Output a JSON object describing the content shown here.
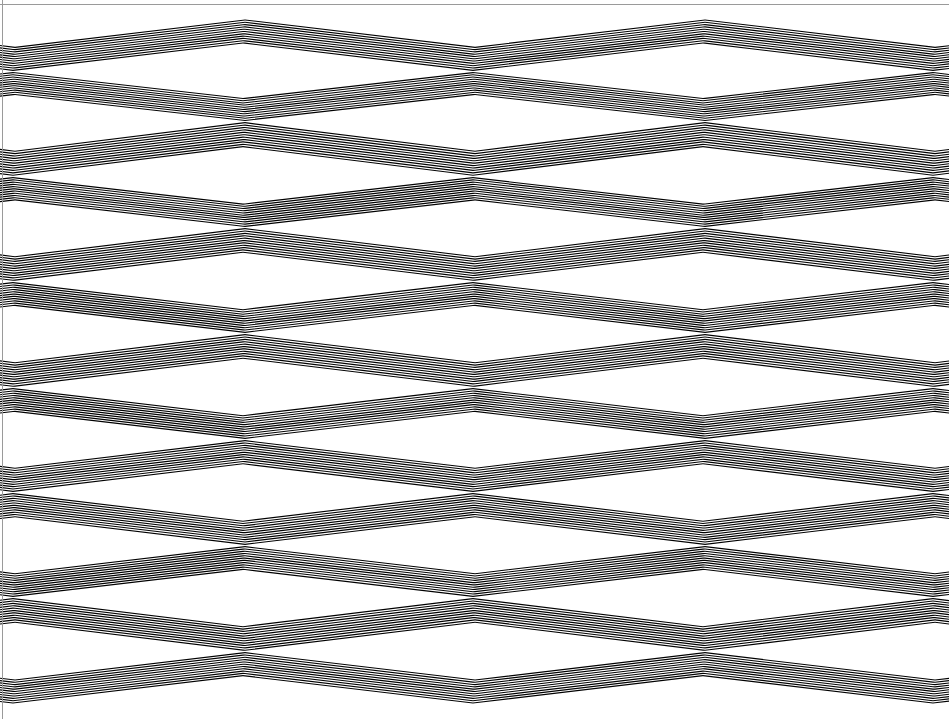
{
  "artwork": {
    "title": "Op Art Chevron Moire Pattern",
    "medium": "black and white line pattern",
    "canvas": {
      "width": 949,
      "height": 719,
      "background_color": "#ffffff",
      "ink_color": "#000000"
    },
    "frame": {
      "border_color": "#9a9a9a",
      "border_width": 1,
      "top_y": 4,
      "left_x": 2,
      "visible_edges": [
        "top",
        "left"
      ]
    },
    "geometry": {
      "description": "Horizontal bands of black stripes forming chevrons. Stripe vertices alternate between two sets of vertical node columns on successive node rows, creating lens/diamond cells that pinch to a point at each node.",
      "node_columns_odd": [
        13,
        473,
        933
      ],
      "node_columns_even": [
        245,
        705
      ],
      "node_rows": [
        {
          "index": 0,
          "y": 72,
          "columns": "odd"
        },
        {
          "index": 1,
          "y": 122,
          "columns": "even"
        },
        {
          "index": 2,
          "y": 177,
          "columns": "odd"
        },
        {
          "index": 3,
          "y": 228,
          "columns": "even"
        },
        {
          "index": 4,
          "y": 282,
          "columns": "odd"
        },
        {
          "index": 5,
          "y": 334,
          "columns": "even"
        },
        {
          "index": 6,
          "y": 388,
          "columns": "odd"
        },
        {
          "index": 7,
          "y": 440,
          "columns": "even"
        },
        {
          "index": 8,
          "y": 493,
          "columns": "odd"
        },
        {
          "index": 9,
          "y": 546,
          "columns": "even"
        },
        {
          "index": 10,
          "y": 598,
          "columns": "odd"
        },
        {
          "index": 11,
          "y": 652,
          "columns": "even"
        }
      ],
      "top_open_apex_y": 27,
      "bottom_open_apex_y": 695,
      "row_pitch_y": 52.7,
      "stripes_per_cell": 11,
      "stripe_duty_cycle": 0.5,
      "max_stripe_thickness_px": 6,
      "pattern_repeat_x": 460,
      "pattern_repeat_y": 105
    },
    "rendering": {
      "stripe_count_total": 264,
      "antialias": true
    }
  }
}
